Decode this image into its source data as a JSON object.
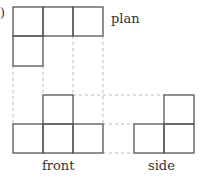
{
  "figure": {
    "paren": ")",
    "labels": {
      "plan": "plan",
      "front": "front",
      "side": "side"
    },
    "views": {
      "plan": {
        "rows": [
          [
            1,
            1,
            1
          ],
          [
            1,
            0,
            0
          ]
        ]
      },
      "front": {
        "rows": [
          [
            0,
            1,
            0
          ],
          [
            1,
            1,
            1
          ]
        ]
      },
      "side": {
        "rows": [
          [
            0,
            1
          ],
          [
            1,
            1
          ]
        ]
      }
    },
    "colors": {
      "line": "#555555",
      "dashed": "#bbbbbb"
    }
  }
}
